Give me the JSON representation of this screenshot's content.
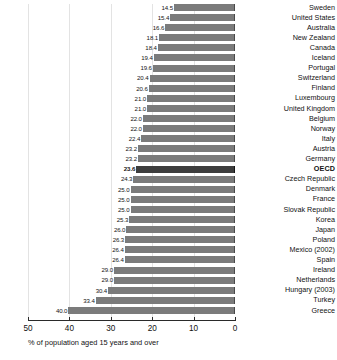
{
  "chart_data": {
    "type": "bar",
    "orientation": "horizontal",
    "title": "",
    "subtitle": "",
    "xlabel": "% of population aged 15 years and over",
    "ylabel": "",
    "xlim": [
      50,
      0
    ],
    "x_axis_reversed": true,
    "grid": true,
    "grid_axis": "x",
    "legend": false,
    "tick_labels": [
      "50",
      "40",
      "30",
      "20",
      "10",
      "0"
    ],
    "tick_values": [
      50,
      40,
      30,
      20,
      10,
      0
    ],
    "highlight_category": "OECD",
    "value_format": "one-decimal",
    "colors": {
      "bar": "#7b7b7b",
      "bar_highlight": "#3d3d3d",
      "bar_edge": "#4a4a4a",
      "gridline": "#e3e3e3",
      "axis": "#2a2a2a",
      "text": "#111111",
      "background": "#ffffff"
    },
    "categories": [
      "Sweden",
      "United States",
      "Australia",
      "New Zealand",
      "Canada",
      "Iceland",
      "Portugal",
      "Switzerland",
      "Finland",
      "Luxembourg",
      "United Kingdom",
      "Belgium",
      "Norway",
      "Italy",
      "Austria",
      "Germany",
      "OECD",
      "Czech Republic",
      "Denmark",
      "France",
      "Slovak Republic",
      "Korea",
      "Japan",
      "Poland",
      "Mexico (2002)",
      "Spain",
      "Ireland",
      "Netherlands",
      "Hungary (2003)",
      "Turkey",
      "Greece"
    ],
    "values": [
      14.5,
      15.4,
      16.6,
      18.1,
      18.4,
      19.4,
      19.6,
      20.4,
      20.6,
      21.0,
      21.0,
      22.0,
      22.0,
      22.4,
      23.2,
      23.2,
      23.6,
      24.3,
      25.0,
      25.0,
      25.0,
      25.3,
      26.0,
      26.3,
      26.4,
      26.4,
      29.0,
      29.0,
      30.4,
      33.4,
      40.0
    ],
    "value_labels": [
      "14.5",
      "15.4",
      "16.6",
      "18.1",
      "18.4",
      "19.4",
      "19.6",
      "20.4",
      "20.6",
      "21.0",
      "21.0",
      "22.0",
      "22.0",
      "22.4",
      "23.2",
      "23.2",
      "23.6",
      "24.3",
      "25.0",
      "25.0",
      "25.0",
      "25.3",
      "26.0",
      "26.3",
      "26.4",
      "26.4",
      "29.0",
      "29.0",
      "30.4",
      "33.4",
      "40.0"
    ]
  }
}
